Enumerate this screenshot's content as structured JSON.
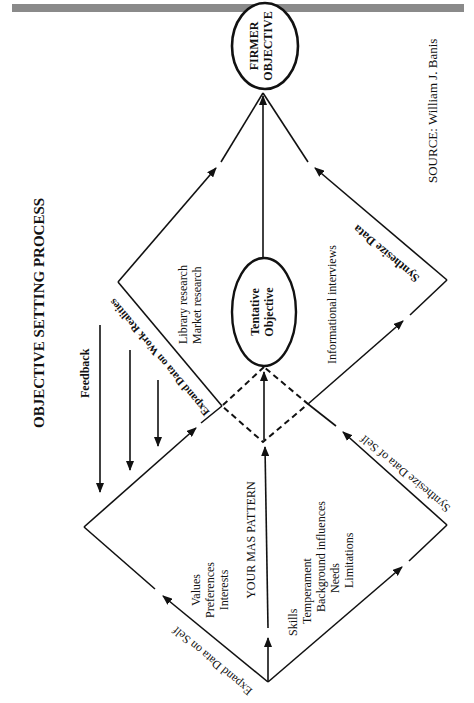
{
  "header": {
    "bar_color": "#8a8a8a"
  },
  "diagram": {
    "title": "OBJECTIVE SETTING PROCESS",
    "source": "SOURCE: William J. Banis",
    "nodes": {
      "firmer_objective": {
        "line1": "FIRMER",
        "line2": "OBJECTIVE"
      },
      "tentative_objective": {
        "line1": "Tentative",
        "line2": "Objective"
      }
    },
    "center_label": "YOUR MAS PATTERN",
    "edges": {
      "expand_self": "Expand Data on Self",
      "synthesize_self": "Synthesize Data of Self",
      "expand_work": "Expand Data on Work Realities",
      "synthesize": "Synthesize Data",
      "feedback": "Feedback"
    },
    "lists": {
      "self_upper": [
        "Values",
        "Preferences",
        "Interests"
      ],
      "self_lower": [
        "Skills",
        "Temperament",
        "Background influences",
        "Needs",
        "Limitations"
      ],
      "work_upper": [
        "Library research",
        "Market research"
      ],
      "work_lower": [
        "Informational interviews"
      ]
    }
  }
}
